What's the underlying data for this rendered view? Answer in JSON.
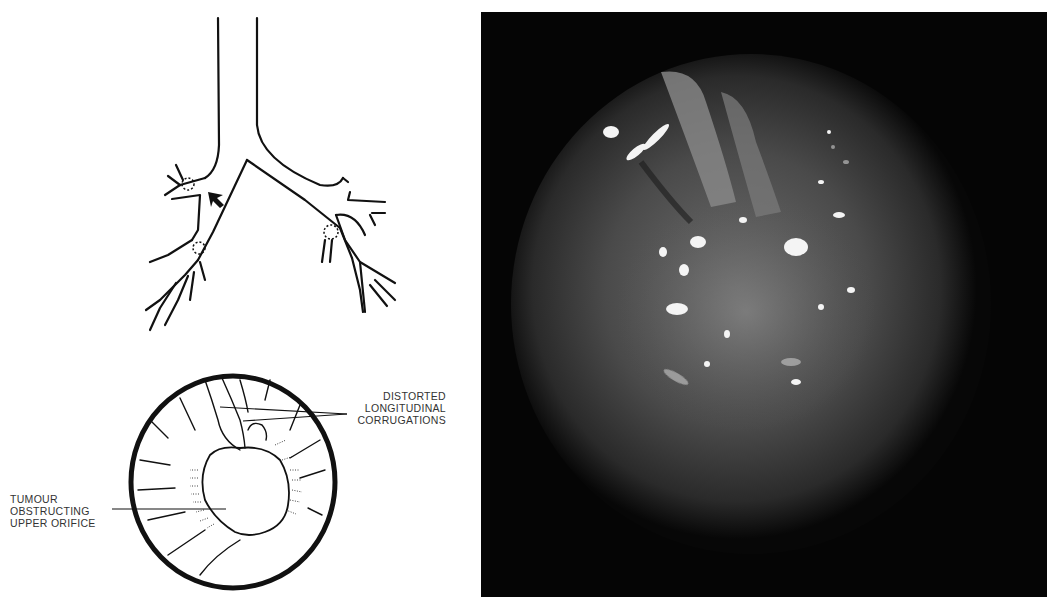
{
  "figure": {
    "bronchial_tree": {
      "description": "Schematic of trachea and bronchial tree with arrow marking lesion site and dotted circles at orifices"
    },
    "endoscopic_view_drawing": {
      "labels": {
        "corrugations": [
          "DISTORTED",
          "LONGITUDINAL",
          "CORRUGATIONS"
        ],
        "tumour": [
          "TUMOUR",
          "OBSTRUCTING",
          "UPPER ORIFICE"
        ]
      }
    },
    "photo": {
      "description": "Bronchoscopic photograph showing tumour obstructing bronchial orifice"
    },
    "colors": {
      "ink": "#111111",
      "photo_bg": "#050505",
      "label": "#333333"
    }
  }
}
